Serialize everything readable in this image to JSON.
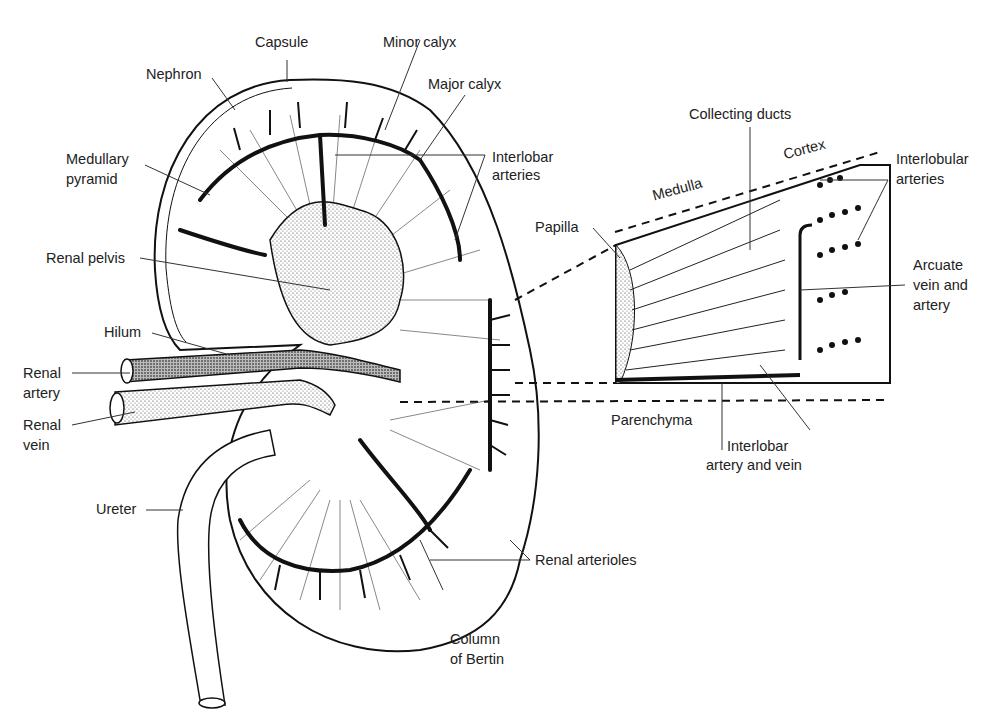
{
  "diagram": {
    "kidney_labels": {
      "capsule": "Capsule",
      "minor_calyx": "Minor calyx",
      "major_calyx": "Major calyx",
      "nephron": "Nephron",
      "medullary_pyramid_1": "Medullary",
      "medullary_pyramid_2": "pyramid",
      "interlobar_arteries_1": "Interlobar",
      "interlobar_arteries_2": "arteries",
      "renal_pelvis": "Renal pelvis",
      "hilum": "Hilum",
      "renal_artery_1": "Renal",
      "renal_artery_2": "artery",
      "renal_vein_1": "Renal",
      "renal_vein_2": "vein",
      "ureter": "Ureter",
      "renal_arterioles": "Renal arterioles",
      "column_of_bertin_1": "Column",
      "column_of_bertin_2": "of Bertin"
    },
    "inset_labels": {
      "collecting_ducts": "Collecting ducts",
      "cortex": "Cortex",
      "medulla": "Medulla",
      "papilla": "Papilla",
      "interlobular_arteries_1": "Interlobular",
      "interlobular_arteries_2": "arteries",
      "arcuate_1": "Arcuate",
      "arcuate_2": "vein and",
      "arcuate_3": "artery",
      "parenchyma": "Parenchyma",
      "interlobar_av_1": "Interlobar",
      "interlobar_av_2": "artery and vein"
    }
  }
}
